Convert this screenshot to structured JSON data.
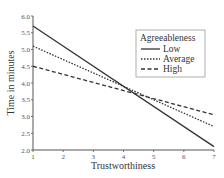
{
  "chart_data": {
    "type": "line",
    "title": "",
    "xlabel": "Trustworthiness",
    "ylabel": "Time in minutes",
    "x": [
      1,
      7
    ],
    "xlim": [
      1,
      7
    ],
    "ylim": [
      2.0,
      6.0
    ],
    "xticks": [
      "1",
      "2",
      "3",
      "4",
      "5",
      "6",
      "7"
    ],
    "yticks": [
      "2.0",
      "2.5",
      "3.0",
      "3.5",
      "4.0",
      "4.5",
      "5.0",
      "5.5",
      "6.0"
    ],
    "grid": false,
    "legend": {
      "title": "Agreeableness",
      "position": "upper right",
      "entries": [
        "Low",
        "Average",
        "High"
      ]
    },
    "series": [
      {
        "name": "Low",
        "style": "solid",
        "values": [
          5.7,
          2.1
        ]
      },
      {
        "name": "Average",
        "style": "dotted",
        "values": [
          5.1,
          2.7
        ]
      },
      {
        "name": "High",
        "style": "dashed",
        "values": [
          4.5,
          3.05
        ]
      }
    ]
  },
  "colors": {
    "line": "#333333",
    "axis": "#555555",
    "legend_border": "#999999"
  }
}
